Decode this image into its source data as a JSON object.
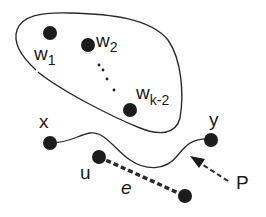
{
  "diagram": {
    "nodes": {
      "w1": {
        "label": "w",
        "sub": "1"
      },
      "w2": {
        "label": "w",
        "sub": "2"
      },
      "wk2": {
        "label": "w",
        "sub": "k-2"
      },
      "x": {
        "label": "x"
      },
      "y": {
        "label": "y"
      },
      "u": {
        "label": "u"
      }
    },
    "edge_label": "e",
    "path_label": "P",
    "colors": {
      "node": "#1c1c1c",
      "line": "#2a2a2a",
      "background": "#ffffff"
    }
  }
}
